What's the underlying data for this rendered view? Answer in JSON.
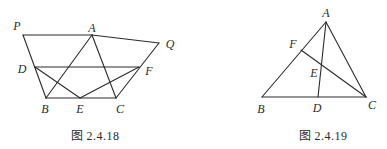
{
  "figures": [
    {
      "caption": "图 2.4.18",
      "points": {
        "P": {
          "label": "P",
          "x": 23,
          "y": 35,
          "lx": 17,
          "ly": 30
        },
        "A": {
          "label": "A",
          "x": 92,
          "y": 35,
          "lx": 92,
          "ly": 32
        },
        "Q": {
          "label": "Q",
          "x": 159,
          "y": 43,
          "lx": 170,
          "ly": 48
        },
        "D": {
          "label": "D",
          "x": 35,
          "y": 67,
          "lx": 22,
          "ly": 73
        },
        "F": {
          "label": "F",
          "x": 139,
          "y": 67,
          "lx": 149,
          "ly": 75
        },
        "B": {
          "label": "B",
          "x": 46,
          "y": 98,
          "lx": 45,
          "ly": 113
        },
        "E": {
          "label": "E",
          "x": 80,
          "y": 98,
          "lx": 80,
          "ly": 113
        },
        "C": {
          "label": "C",
          "x": 116,
          "y": 98,
          "lx": 120,
          "ly": 113
        }
      },
      "segments": [
        [
          "P",
          "A"
        ],
        [
          "A",
          "Q"
        ],
        [
          "P",
          "B"
        ],
        [
          "Q",
          "C"
        ],
        [
          "D",
          "F"
        ],
        [
          "B",
          "C"
        ],
        [
          "A",
          "B"
        ],
        [
          "A",
          "C"
        ],
        [
          "D",
          "E"
        ],
        [
          "E",
          "F"
        ]
      ],
      "caption_pos": {
        "x": 95,
        "y": 140
      }
    },
    {
      "caption": "图 2.4.19",
      "points": {
        "A": {
          "label": "A",
          "x": 326,
          "y": 22,
          "lx": 326,
          "ly": 17
        },
        "F": {
          "label": "F",
          "x": 301,
          "y": 50,
          "lx": 293,
          "ly": 48
        },
        "E": {
          "label": "E",
          "x": 322,
          "y": 65,
          "lx": 314,
          "ly": 77
        },
        "B": {
          "label": "B",
          "x": 262,
          "y": 97,
          "lx": 261,
          "ly": 113
        },
        "D": {
          "label": "D",
          "x": 318,
          "y": 97,
          "lx": 317,
          "ly": 112
        },
        "C": {
          "label": "C",
          "x": 366,
          "y": 97,
          "lx": 372,
          "ly": 109
        }
      },
      "segments": [
        [
          "A",
          "B"
        ],
        [
          "A",
          "C"
        ],
        [
          "B",
          "C"
        ],
        [
          "A",
          "D"
        ],
        [
          "F",
          "C"
        ]
      ],
      "caption_pos": {
        "x": 323,
        "y": 140
      }
    }
  ]
}
